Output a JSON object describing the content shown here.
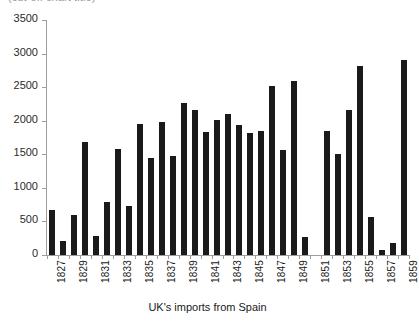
{
  "chart_data": {
    "type": "bar",
    "title": "",
    "xlabel": "UK's imports from Spain",
    "ylabel": "",
    "ylim": [
      0,
      3500
    ],
    "ytick_values": [
      0,
      500,
      1000,
      1500,
      2000,
      2500,
      3000,
      3500
    ],
    "ytick_labels": [
      "0",
      "500",
      "1000",
      "1500",
      "2000",
      "2500",
      "3000",
      "3500"
    ],
    "grid": false,
    "legend": "none",
    "bar_color": "#1a1a1a",
    "categories": [
      "1827",
      "1828",
      "1829",
      "1830",
      "1831",
      "1832",
      "1833",
      "1834",
      "1835",
      "1836",
      "1837",
      "1838",
      "1839",
      "1840",
      "1841",
      "1842",
      "1843",
      "1844",
      "1845",
      "1846",
      "1847",
      "1848",
      "1849",
      "1850",
      "1851",
      "1852",
      "1853",
      "1854",
      "1855",
      "1856",
      "1857",
      "1858",
      "1859"
    ],
    "xtick_labels": [
      "1827",
      "",
      "1829",
      "",
      "1831",
      "",
      "1833",
      "",
      "1835",
      "",
      "1837",
      "",
      "1839",
      "",
      "1841",
      "",
      "1843",
      "",
      "1845",
      "",
      "1847",
      "",
      "1849",
      "",
      "1851",
      "",
      "1853",
      "",
      "1855",
      "",
      "1857",
      "",
      "1859"
    ],
    "values": [
      665,
      205,
      590,
      1680,
      285,
      785,
      1585,
      725,
      1955,
      1450,
      1985,
      1470,
      2265,
      2165,
      1830,
      2015,
      2095,
      1940,
      1810,
      1845,
      2515,
      1570,
      2595,
      265,
      null,
      1850,
      1505,
      2165,
      2820,
      560,
      70,
      185,
      2905
    ]
  },
  "clipped_title": {
    "text": "(cut-off chart title)"
  }
}
